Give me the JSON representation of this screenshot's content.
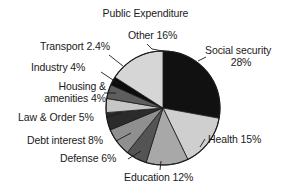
{
  "chart_data": {
    "type": "pie",
    "title": "Public Expenditure",
    "xlabel": "",
    "ylabel": "",
    "legend": "none",
    "grid": false,
    "start_angle_deg": 0,
    "direction": "clockwise",
    "categories": [
      "Social security",
      "Health",
      "Education",
      "Defense",
      "Debt interest",
      "Law & Order",
      "Housing & amenities",
      "Industry",
      "Transport",
      "Other"
    ],
    "values": [
      28,
      15,
      12,
      6,
      8,
      5,
      4,
      4,
      2.4,
      16
    ],
    "value_unit": "%",
    "slices": [
      {
        "label": "Social security",
        "value": 28,
        "value_text": "28%",
        "color": "#111111"
      },
      {
        "label": "Health",
        "value": 15,
        "value_text": "15%",
        "color": "#cfcfcf"
      },
      {
        "label": "Education",
        "value": 12,
        "value_text": "12%",
        "color": "#a8a8a8"
      },
      {
        "label": "Defense",
        "value": 6,
        "value_text": "6%",
        "color": "#545454"
      },
      {
        "label": "Debt interest",
        "value": 8,
        "value_text": "8%",
        "color": "#8f8f8f"
      },
      {
        "label": "Law & Order",
        "value": 5,
        "value_text": "5%",
        "color": "#2b2b2b"
      },
      {
        "label": "Housing & amenities",
        "value": 4,
        "value_text": "4%",
        "color": "#c6c6c6"
      },
      {
        "label": "Industry",
        "value": 4,
        "value_text": "4%",
        "color": "#5e5e5e"
      },
      {
        "label": "Transport",
        "value": 2.4,
        "value_text": "2.4%",
        "color": "#0d0d0d"
      },
      {
        "label": "Other",
        "value": 16,
        "value_text": "16%",
        "color": "#d6d6d6"
      }
    ]
  },
  "labels": {
    "title": "Public Expenditure",
    "other": "Other 16%",
    "social_security_name": "Social security",
    "social_security_pct": "28%",
    "health": "Health 15%",
    "education": "Education 12%",
    "defense": "Defense 6%",
    "debt_interest": "Debt interest 8%",
    "law_order": "Law & Order 5%",
    "housing_line1": "Housing &",
    "housing_line2": "amenities 4%",
    "industry": "Industry 4%",
    "transport": "Transport 2.4%"
  },
  "colors": {
    "background": "#ffffff",
    "text": "#1a1a1a",
    "outline": "#1a1a1a",
    "leader": "#1a1a1a"
  }
}
